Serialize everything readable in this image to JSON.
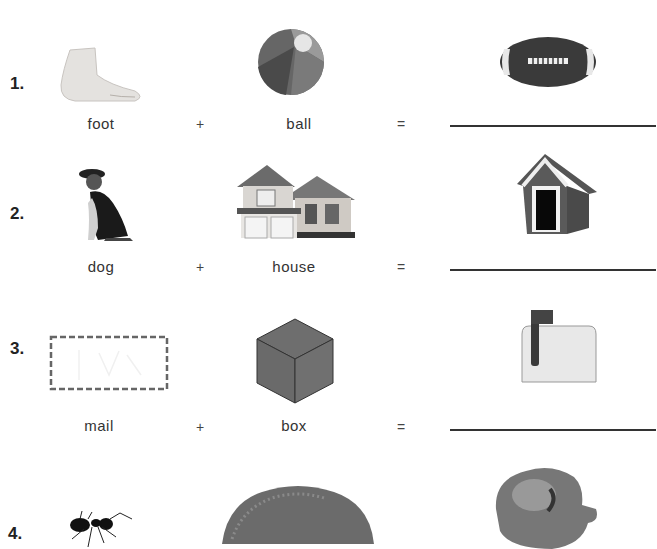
{
  "worksheet": {
    "problems": [
      {
        "number": "1.",
        "first_word": "foot",
        "first_image": "foot-image",
        "plus": "+",
        "second_word": "ball",
        "second_image": "beach-ball-image",
        "equals": "=",
        "answer_image": "football-image",
        "answer": ""
      },
      {
        "number": "2.",
        "first_word": "dog",
        "first_image": "dog-image",
        "plus": "+",
        "second_word": "house",
        "second_image": "house-image",
        "equals": "=",
        "answer_image": "doghouse-image",
        "answer": ""
      },
      {
        "number": "3.",
        "first_word": "mail",
        "first_image": "envelope-image",
        "plus": "+",
        "second_word": "box",
        "second_image": "cube-box-image",
        "equals": "=",
        "answer_image": "mailbox-image",
        "answer": ""
      },
      {
        "number": "4.",
        "first_image": "ant-image",
        "second_image": "hill-image",
        "answer_image": "anthill-image"
      }
    ]
  }
}
